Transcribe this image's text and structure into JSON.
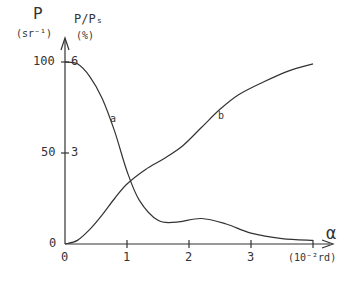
{
  "chart_data": {
    "type": "line",
    "title": "",
    "xlabel": "α",
    "x_unit": "(10⁻²rd)",
    "ylabel_left": "P (sr⁻¹)",
    "ylabel_left_symbol": "P",
    "ylabel_left_unit": "(sr⁻¹)",
    "ylabel_right": "P/Pₛ (%)",
    "ylabel_right_symbol": "P/Pₛ",
    "ylabel_right_unit": "(%)",
    "x_ticks": [
      "0",
      "1",
      "2",
      "3"
    ],
    "y_ticks_left": [
      "0",
      "50",
      "100"
    ],
    "y_ticks_right": [
      "3",
      "6"
    ],
    "xlim": [
      0,
      4
    ],
    "ylim": [
      0,
      100
    ],
    "grid": false,
    "series": [
      {
        "name": "a",
        "x": [
          0,
          0.2,
          0.4,
          0.6,
          0.8,
          1.0,
          1.2,
          1.5,
          1.8,
          2.2,
          2.6,
          3.0,
          3.5,
          4.0
        ],
        "values": [
          100,
          99,
          92,
          80,
          62,
          40,
          24,
          13,
          12,
          14,
          11,
          6,
          3,
          2
        ]
      },
      {
        "name": "b",
        "x": [
          0,
          0.2,
          0.4,
          0.6,
          0.8,
          1.0,
          1.3,
          1.6,
          1.9,
          2.2,
          2.5,
          2.8,
          3.2,
          3.6,
          4.0
        ],
        "values": [
          0,
          2,
          8,
          16,
          25,
          33,
          41,
          47,
          54,
          64,
          74,
          82,
          89,
          95,
          99
        ]
      }
    ]
  }
}
